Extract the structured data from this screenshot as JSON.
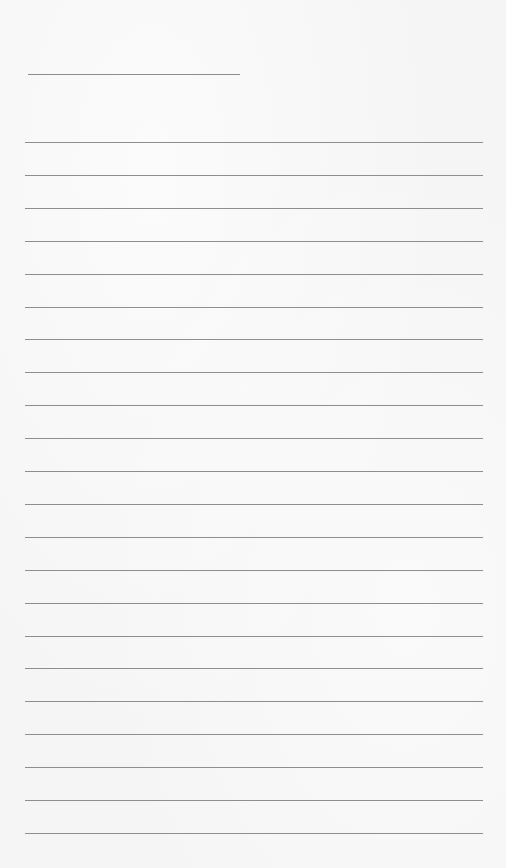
{
  "page": {
    "type": "lined-paper",
    "background_color": "#f5f5f5",
    "line_color": "#8e8e8e",
    "header_line": {
      "label": "",
      "x": 28,
      "y": 74,
      "width": 212
    },
    "ruled_lines": {
      "count": 22,
      "start_y": 142,
      "spacing": 32.9,
      "x": 25,
      "width": 458
    }
  }
}
